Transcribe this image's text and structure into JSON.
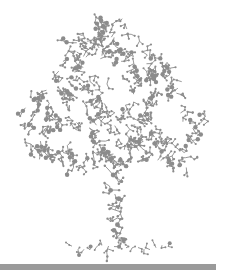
{
  "illustration": {
    "subject": "tree made of molecular ball-and-stick structures",
    "colors": {
      "background": "#ffffff",
      "molecule": "#8c8c8c",
      "ground_bar": "#9a9a9a"
    },
    "canopy": {
      "cx": 114,
      "top": 18,
      "bottom": 168,
      "left": 22,
      "right": 212
    },
    "trunk": {
      "x": 114,
      "top": 150,
      "bottom": 250
    },
    "roots": {
      "y": 248,
      "left": 72,
      "right": 168
    },
    "ground_bar": {
      "x": 0,
      "y": 264,
      "width": 216,
      "height": 6
    }
  }
}
